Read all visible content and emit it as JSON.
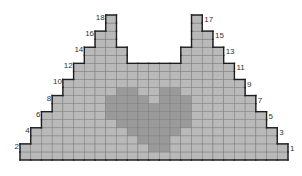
{
  "diagram": {
    "type": "knitting-chart",
    "columns": 25,
    "rows": 18,
    "colors": {
      "background": "#ffffff",
      "cell": "#b9b9b9",
      "motif": "#9a9a9a",
      "grid_line": "#7a7a7a",
      "outline": "#1e1e1e",
      "label": "#333333"
    },
    "row_spans": [
      {
        "row": 1,
        "spans": [
          [
            0,
            24
          ]
        ]
      },
      {
        "row": 2,
        "spans": [
          [
            0,
            24
          ]
        ]
      },
      {
        "row": 3,
        "spans": [
          [
            1,
            23
          ]
        ]
      },
      {
        "row": 4,
        "spans": [
          [
            1,
            23
          ]
        ]
      },
      {
        "row": 5,
        "spans": [
          [
            2,
            22
          ]
        ]
      },
      {
        "row": 6,
        "spans": [
          [
            2,
            22
          ]
        ]
      },
      {
        "row": 7,
        "spans": [
          [
            3,
            21
          ]
        ]
      },
      {
        "row": 8,
        "spans": [
          [
            3,
            21
          ]
        ]
      },
      {
        "row": 9,
        "spans": [
          [
            4,
            20
          ]
        ]
      },
      {
        "row": 10,
        "spans": [
          [
            4,
            20
          ]
        ]
      },
      {
        "row": 11,
        "spans": [
          [
            5,
            19
          ]
        ]
      },
      {
        "row": 12,
        "spans": [
          [
            5,
            19
          ]
        ]
      },
      {
        "row": 13,
        "spans": [
          [
            6,
            9
          ],
          [
            15,
            18
          ]
        ]
      },
      {
        "row": 14,
        "spans": [
          [
            6,
            9
          ],
          [
            15,
            18
          ]
        ]
      },
      {
        "row": 15,
        "spans": [
          [
            7,
            8
          ],
          [
            16,
            17
          ]
        ]
      },
      {
        "row": 16,
        "spans": [
          [
            7,
            8
          ],
          [
            16,
            17
          ]
        ]
      },
      {
        "row": 17,
        "spans": [
          [
            8,
            8
          ],
          [
            16,
            16
          ]
        ]
      },
      {
        "row": 18,
        "spans": [
          [
            8,
            8
          ],
          [
            16,
            16
          ]
        ]
      }
    ],
    "motif": {
      "name": "heart",
      "cells": [
        {
          "row": 9,
          "cols": [
            9,
            10,
            13,
            14
          ]
        },
        {
          "row": 8,
          "cols": [
            8,
            9,
            10,
            11,
            13,
            14,
            15
          ]
        },
        {
          "row": 7,
          "cols": [
            8,
            9,
            10,
            11,
            12,
            13,
            14,
            15
          ]
        },
        {
          "row": 6,
          "cols": [
            8,
            9,
            10,
            11,
            12,
            13,
            14,
            15
          ]
        },
        {
          "row": 5,
          "cols": [
            9,
            10,
            11,
            12,
            13,
            14,
            15
          ]
        },
        {
          "row": 4,
          "cols": [
            10,
            11,
            12,
            13,
            14
          ]
        },
        {
          "row": 3,
          "cols": [
            11,
            12,
            13
          ]
        },
        {
          "row": 2,
          "cols": [
            12,
            13
          ]
        }
      ]
    },
    "row_labels": [
      {
        "text": "1",
        "side": "right",
        "row": 1
      },
      {
        "text": "2",
        "side": "left",
        "row": 2
      },
      {
        "text": "3",
        "side": "right",
        "row": 3
      },
      {
        "text": "4",
        "side": "left",
        "row": 4
      },
      {
        "text": "5",
        "side": "right",
        "row": 5
      },
      {
        "text": "6",
        "side": "left",
        "row": 6
      },
      {
        "text": "7",
        "side": "right",
        "row": 7
      },
      {
        "text": "8",
        "side": "left",
        "row": 8
      },
      {
        "text": "9",
        "side": "right",
        "row": 9
      },
      {
        "text": "10",
        "side": "left",
        "row": 10
      },
      {
        "text": "11",
        "side": "right",
        "row": 11
      },
      {
        "text": "12",
        "side": "left",
        "row": 12
      },
      {
        "text": "13",
        "side": "right",
        "row": 13
      },
      {
        "text": "14",
        "side": "left",
        "row": 14
      },
      {
        "text": "15",
        "side": "right",
        "row": 15
      },
      {
        "text": "16",
        "side": "left",
        "row": 16
      },
      {
        "text": "17",
        "side": "right",
        "row": 17
      },
      {
        "text": "18",
        "side": "left",
        "row": 18
      }
    ]
  }
}
